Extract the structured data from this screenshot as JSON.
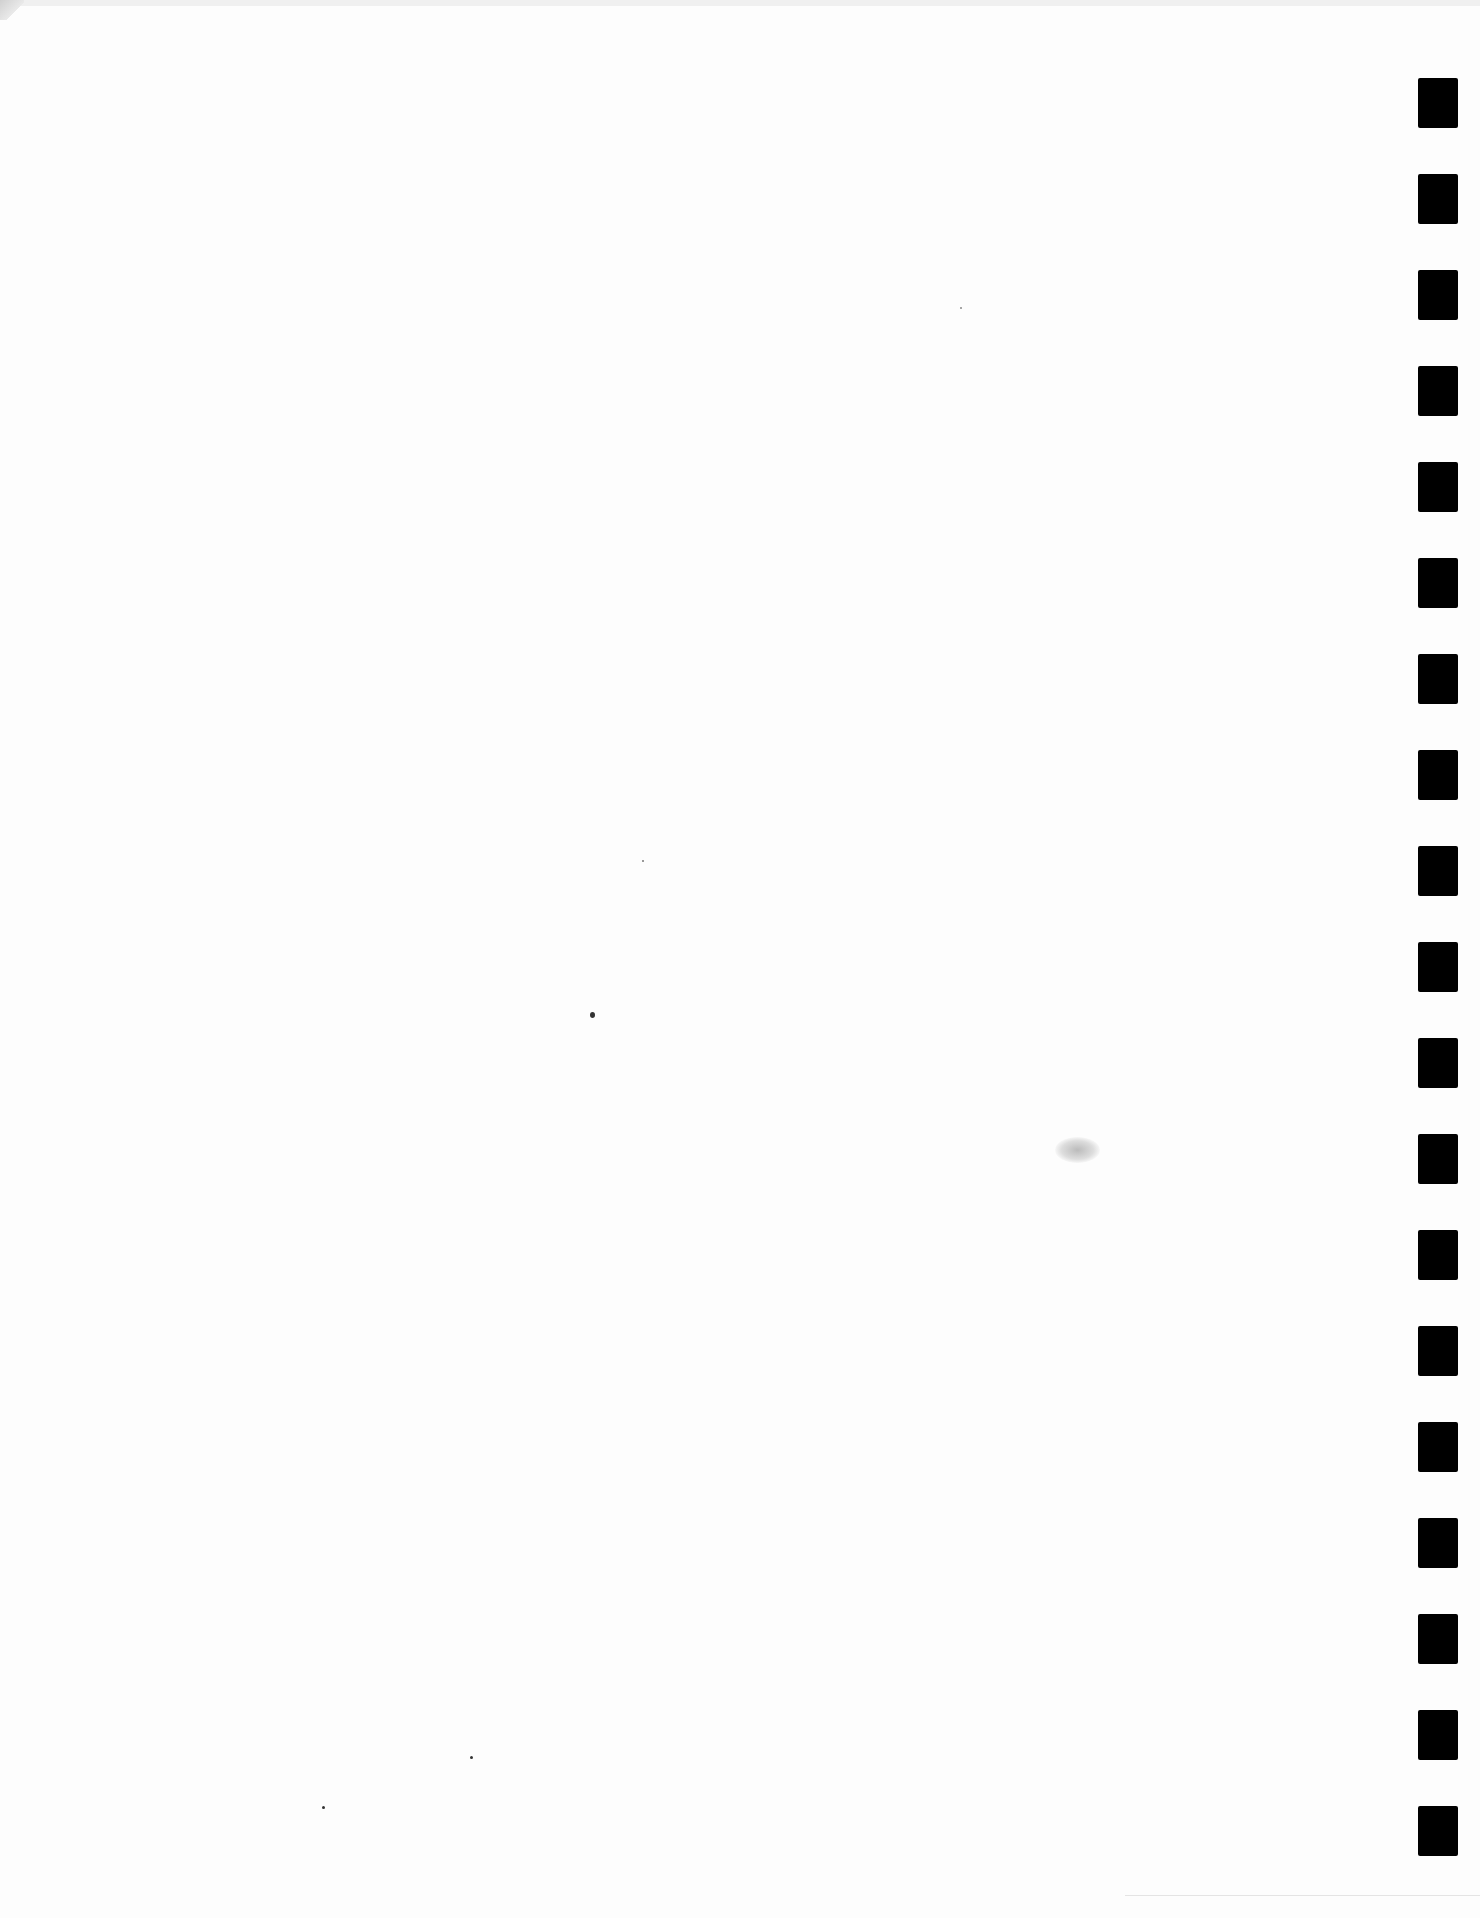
{
  "document": {
    "type": "scanned blank page",
    "content_text": "",
    "timing_marks": {
      "count": 19,
      "color": "#000000",
      "position": "right edge",
      "tops": [
        78,
        174,
        270,
        366,
        462,
        558,
        654,
        750,
        846,
        942,
        1038,
        1134,
        1230,
        1326,
        1422,
        1518,
        1614,
        1710,
        1806
      ]
    }
  }
}
